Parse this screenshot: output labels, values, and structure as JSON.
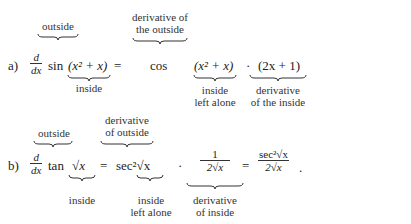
{
  "part_a": {
    "label": "a)",
    "deriv_num": "d",
    "deriv_den": "dx",
    "func": "sin",
    "inside_expr": "(x² + x)",
    "equals": "=",
    "outer_derivative": "cos",
    "inside_left_alone_expr": "(x² + x)",
    "dot": "·",
    "inner_derivative_expr": "(2x + 1)",
    "annotations": {
      "outside": "outside",
      "derivative_of_outside_line1": "derivative of",
      "derivative_of_outside_line2": "the outside",
      "inside": "inside",
      "inside_left_alone_line1": "inside",
      "inside_left_alone_line2": "left alone",
      "derivative_of_inside_line1": "derivative",
      "derivative_of_inside_line2": "of the inside"
    }
  },
  "part_b": {
    "label": "b)",
    "deriv_num": "d",
    "deriv_den": "dx",
    "func": "tan",
    "inside_expr": "√x",
    "equals": "=",
    "outer_derivative": "sec²√x",
    "dot": "·",
    "inner_derivative_num": "1",
    "inner_derivative_den": "2√x",
    "equals2": "=",
    "result_num": "sec²√x",
    "result_den": "2√x",
    "period": ".",
    "annotations": {
      "outside": "outside",
      "derivative_of_outside_line1": "derivative",
      "derivative_of_outside_line2": "of outside",
      "inside": "inside",
      "inside_left_alone_line1": "inside",
      "inside_left_alone_line2": "left alone",
      "derivative_of_inside_line1": "derivative",
      "derivative_of_inside_line2": "of inside"
    }
  }
}
